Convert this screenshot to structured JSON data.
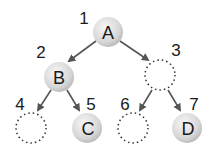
{
  "diagram": {
    "type": "binary-tree",
    "nodes": [
      {
        "index": "1",
        "label": "A",
        "filled": true
      },
      {
        "index": "2",
        "label": "B",
        "filled": true
      },
      {
        "index": "3",
        "label": "",
        "filled": false
      },
      {
        "index": "4",
        "label": "",
        "filled": false
      },
      {
        "index": "5",
        "label": "C",
        "filled": true
      },
      {
        "index": "6",
        "label": "",
        "filled": false
      },
      {
        "index": "7",
        "label": "D",
        "filled": true
      }
    ],
    "edges": [
      [
        "1",
        "2"
      ],
      [
        "1",
        "3"
      ],
      [
        "2",
        "4"
      ],
      [
        "2",
        "5"
      ],
      [
        "3",
        "6"
      ],
      [
        "3",
        "7"
      ]
    ],
    "colors": {
      "node_fill": "#d8d8d8",
      "edge": "#555555",
      "dotted_outline": "#333333"
    }
  }
}
